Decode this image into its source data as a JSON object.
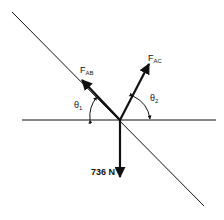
{
  "diagram": {
    "type": "free-body force diagram",
    "labels": {
      "fab_main": "F",
      "fab_sub": "AB",
      "fac_main": "F",
      "fac_sub": "AC",
      "theta1_main": "θ",
      "theta1_sub": "1",
      "theta2_main": "θ",
      "theta2_sub": "2",
      "weight": "736 N"
    },
    "colors": {
      "line": "#111111",
      "background": "#ffffff"
    }
  }
}
